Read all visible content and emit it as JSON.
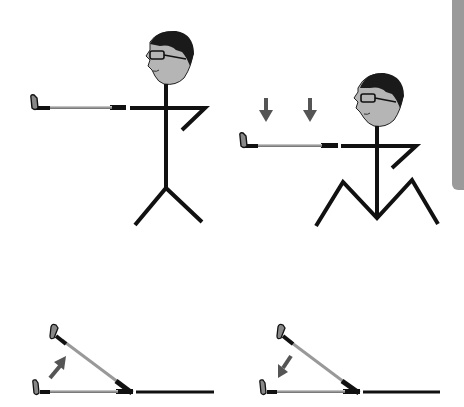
{
  "figure": {
    "title": "",
    "panels": [
      {
        "id": "standing",
        "description": "Stick figure standing upright with arm and club extended horizontally"
      },
      {
        "id": "squatting",
        "description": "Stick figure with bent knees, club lowered, down arrows indicating lowering"
      },
      {
        "id": "club-raise",
        "description": "Club shaft pivoting upward from ground, arrow pointing up"
      },
      {
        "id": "club-lower",
        "description": "Club shaft pivoting downward to ground, arrow pointing down"
      }
    ],
    "icons": [
      "down-arrow",
      "down-arrow",
      "up-arrow",
      "down-left-arrow"
    ]
  },
  "colors": {
    "line": "#111111",
    "face": "#b5b5b5",
    "hair": "#1a1a1a",
    "shaft": "#aaaaaa",
    "arrow": "#555555",
    "side_tab": "#9a9a9a"
  }
}
